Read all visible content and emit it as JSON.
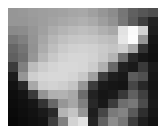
{
  "image": {
    "title": "pixelated-grayscale-photo",
    "description": "Low-resolution blocky grayscale image: bright smooth region upper-left and center, a white highlight near upper-right, and dark terrain across the lower-right and bottom.",
    "color_mode": "grayscale",
    "background_color": "#ffffff",
    "border_color": "#ffffff",
    "block_grid": {
      "columns": 15,
      "rows": 13
    },
    "content_box": {
      "x": 8,
      "y": 8,
      "width": 150,
      "height": 118
    },
    "canvas_size": {
      "width": 165,
      "height": 131
    },
    "value_range": {
      "min": 8,
      "max": 252
    },
    "pixels": [
      [
        150,
        152,
        156,
        158,
        160,
        162,
        166,
        168,
        160,
        150,
        140,
        118,
        96,
        86,
        78
      ],
      [
        150,
        150,
        154,
        158,
        163,
        168,
        172,
        176,
        170,
        158,
        146,
        120,
        92,
        62,
        34
      ],
      [
        138,
        140,
        150,
        160,
        172,
        180,
        186,
        190,
        186,
        176,
        168,
        226,
        250,
        210,
        30
      ],
      [
        118,
        128,
        148,
        166,
        182,
        192,
        198,
        200,
        198,
        192,
        188,
        230,
        252,
        150,
        22
      ],
      [
        102,
        116,
        146,
        172,
        190,
        202,
        208,
        210,
        208,
        202,
        196,
        206,
        168,
        52,
        18
      ],
      [
        96,
        110,
        150,
        182,
        200,
        210,
        214,
        214,
        210,
        200,
        180,
        110,
        40,
        22,
        16
      ],
      [
        60,
        128,
        188,
        204,
        212,
        216,
        216,
        214,
        204,
        176,
        104,
        34,
        26,
        58,
        26
      ],
      [
        28,
        150,
        206,
        214,
        216,
        216,
        212,
        200,
        160,
        62,
        30,
        24,
        92,
        80,
        22
      ],
      [
        18,
        40,
        168,
        206,
        210,
        206,
        196,
        150,
        60,
        26,
        22,
        20,
        70,
        40,
        20
      ],
      [
        14,
        20,
        58,
        148,
        176,
        178,
        168,
        108,
        34,
        22,
        26,
        56,
        96,
        64,
        24
      ],
      [
        12,
        16,
        22,
        52,
        104,
        150,
        166,
        128,
        40,
        24,
        60,
        110,
        120,
        76,
        26
      ],
      [
        10,
        14,
        18,
        26,
        42,
        180,
        196,
        150,
        30,
        70,
        122,
        132,
        90,
        46,
        22
      ],
      [
        8,
        12,
        16,
        20,
        62,
        128,
        210,
        226,
        36,
        96,
        140,
        118,
        60,
        30,
        18
      ]
    ]
  }
}
